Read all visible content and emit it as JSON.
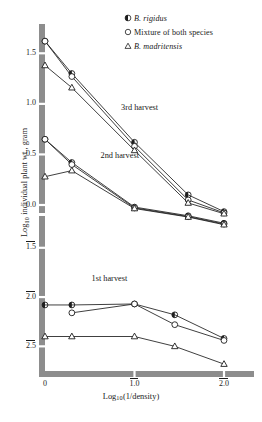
{
  "figure": {
    "background": "#ffffff",
    "ink": "#1d1d1d",
    "axis_color": "#8d8d8d"
  },
  "chart_data": {
    "type": "line",
    "title": "",
    "subtitle": "",
    "xlabel": "Log10(1/density)",
    "ylabel": "Log10 individual plant wt., gram",
    "xlim": [
      0.0,
      -2.15
    ],
    "ylim": [
      -2.75,
      1.75
    ],
    "grid": false,
    "axis_note": "y axis drawn with a scale break between 0.0 and -1.5",
    "legend": {
      "position": "top-right",
      "entries": [
        {
          "marker": "half-filled-circle",
          "label": "B. rigidus",
          "italic": true
        },
        {
          "marker": "open-circle",
          "label": "Mixture of both species",
          "italic": false
        },
        {
          "marker": "open-triangle",
          "label": "B. madritensis",
          "italic": true
        }
      ]
    },
    "x_ticks": [
      {
        "value": 0.0,
        "label": "0",
        "overbar": false
      },
      {
        "value": -1.0,
        "label": "1.0",
        "overbar": true
      },
      {
        "value": -2.0,
        "label": "2.0",
        "overbar": true
      }
    ],
    "y_ticks": [
      {
        "value": 1.5,
        "label": "1.5",
        "overbar": false
      },
      {
        "value": 1.0,
        "label": "1.0",
        "overbar": false
      },
      {
        "value": 0.5,
        "label": "0.5",
        "overbar": false
      },
      {
        "value": 0.0,
        "label": "0.0",
        "overbar": false
      },
      {
        "value": -1.5,
        "label": "1.5",
        "overbar": true
      },
      {
        "value": -2.0,
        "label": "2.0",
        "overbar": true
      },
      {
        "value": -2.5,
        "label": "2.5",
        "overbar": true
      }
    ],
    "annotations": [
      {
        "text": "3rd harvest",
        "x": -0.85,
        "y": 0.95
      },
      {
        "text": "2nd harvest",
        "x": -0.62,
        "y": 0.47
      },
      {
        "text": "1st harvest",
        "x": -0.52,
        "y": -1.83
      }
    ],
    "groups": [
      {
        "name": "3rd harvest",
        "series": [
          {
            "name": "B. rigidus",
            "marker": "half-filled-circle",
            "x": [
              0.0,
              -0.3,
              -1.0,
              -1.6,
              -2.0
            ],
            "y": [
              1.62,
              1.3,
              0.62,
              0.1,
              -0.32
            ]
          },
          {
            "name": "Mixture of both species",
            "marker": "open-circle",
            "x": [
              0.0,
              -0.3,
              -1.0,
              -1.6,
              -2.0
            ],
            "y": [
              1.62,
              1.27,
              0.58,
              0.05,
              -0.38
            ]
          },
          {
            "name": "B. madritensis",
            "marker": "open-triangle",
            "x": [
              0.0,
              -0.3,
              -1.0,
              -1.6,
              -2.0
            ],
            "y": [
              1.38,
              1.16,
              0.54,
              0.02,
              -0.42
            ]
          }
        ]
      },
      {
        "name": "2nd harvest",
        "series": [
          {
            "name": "B. rigidus",
            "marker": "half-filled-circle",
            "x": [
              0.0,
              -0.3,
              -1.0,
              -1.6,
              -2.0
            ],
            "y": [
              0.65,
              0.42,
              -0.1,
              -0.52,
              -0.88
            ]
          },
          {
            "name": "Mixture of both species",
            "marker": "open-circle",
            "x": [
              0.0,
              -0.3,
              -1.0,
              -1.6,
              -2.0
            ],
            "y": [
              0.65,
              0.4,
              -0.14,
              -0.56,
              -0.92
            ]
          },
          {
            "name": "B. madritensis",
            "marker": "open-triangle",
            "x": [
              0.0,
              -0.3,
              -1.0,
              -1.6,
              -2.0
            ],
            "y": [
              0.28,
              0.34,
              -0.17,
              -0.58,
              -0.95
            ]
          }
        ]
      },
      {
        "name": "1st harvest",
        "series": [
          {
            "name": "B. rigidus",
            "marker": "half-filled-circle",
            "x": [
              0.0,
              -0.3,
              -1.0,
              -1.45,
              -2.0
            ],
            "y": [
              -2.08,
              -2.08,
              -2.07,
              -2.18,
              -2.42
            ]
          },
          {
            "name": "Mixture of both species",
            "marker": "open-circle",
            "x": [
              -0.3,
              -1.0,
              -1.45,
              -2.0
            ],
            "y": [
              -2.16,
              -2.07,
              -2.28,
              -2.44
            ]
          },
          {
            "name": "B. madritensis",
            "marker": "open-triangle",
            "x": [
              0.0,
              -0.3,
              -1.0,
              -1.45,
              -2.0
            ],
            "y": [
              -2.4,
              -2.4,
              -2.4,
              -2.5,
              -2.68
            ]
          }
        ]
      }
    ]
  }
}
